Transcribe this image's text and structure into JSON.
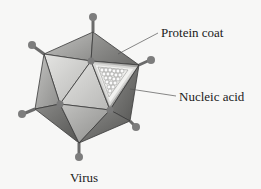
{
  "diagram": {
    "title": "Virus",
    "labels": {
      "protein_coat": "Protein coat",
      "nucleic_acid": "Nucleic acid"
    },
    "colors": {
      "background": "#f7f7f6",
      "spike": "#7a7a7a",
      "face_light": "#d4d4d2",
      "face_mid": "#a9a9a7",
      "face_dark": "#6e6e6c",
      "edge": "#3a3a3a",
      "leader_line": "#555555"
    }
  }
}
